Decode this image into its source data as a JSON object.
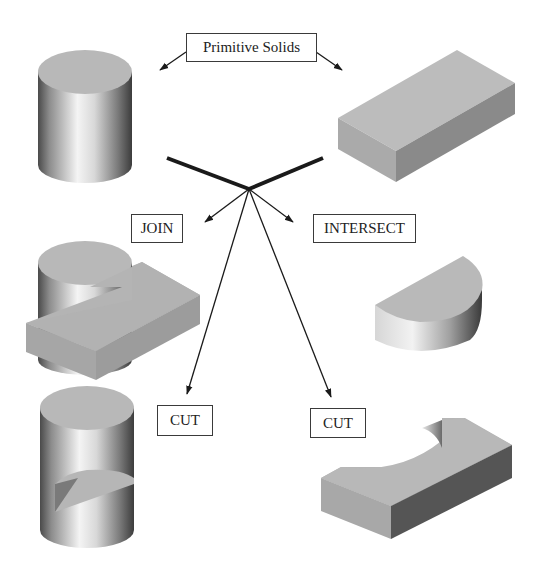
{
  "diagram": {
    "title_label": "Primitive Solids",
    "operations": {
      "join": "JOIN",
      "intersect": "INTERSECT",
      "cut_left": "CUT",
      "cut_right": "CUT"
    },
    "solids": {
      "primitive_1": "cylinder",
      "primitive_2": "rectangular block",
      "join_result": "cylinder joined with block",
      "intersect_result": "half-cylinder",
      "cut_left_result": "cylinder with block removed",
      "cut_right_result": "block with cylindrical cut-out"
    },
    "colors": {
      "face_top": "#b9b9b9",
      "face_front": "#a8a8a8",
      "face_side_dark": "#5a5a5a",
      "line": "#1a1a1a"
    }
  }
}
